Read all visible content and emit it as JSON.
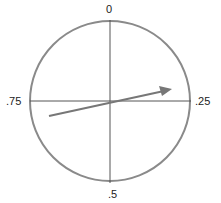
{
  "diagram": {
    "labels": {
      "top": "0",
      "right": ".25",
      "bottom": ".5",
      "left": ".75"
    },
    "circle": {
      "cx": 110,
      "cy": 101,
      "r": 80,
      "stroke": "#8a8a8a"
    },
    "arrow": {
      "x1": 49,
      "y1": 116,
      "x2": 172,
      "y2": 89,
      "color": "#777777"
    }
  }
}
